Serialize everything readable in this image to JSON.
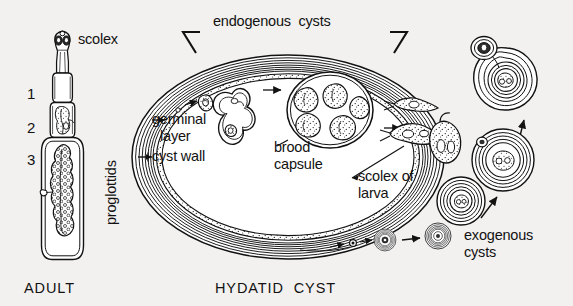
{
  "figure": {
    "title_left": "ADULT",
    "title_center": "HYDATID CYST",
    "background_color": "#f2f1ef",
    "ink_color": "#121212",
    "type": "scientific-illustration"
  },
  "labels": {
    "scolex": "scolex",
    "proglottids": "proglottids",
    "segment_1": "1",
    "segment_2": "2",
    "segment_3": "3",
    "endogenous_cysts": "endogenous  cysts",
    "germinal_layer": "germinal\nlayer",
    "germinal_layer_line1": "germinal",
    "germinal_layer_line2": "layer",
    "cyst_wall": "cyst wall",
    "brood_capsule_line1": "brood",
    "brood_capsule_line2": "capsule",
    "scolex_of_larva_line1": "scolex of",
    "scolex_of_larva_line2": "larva",
    "exogenous_cysts_line1": "exogenous",
    "exogenous_cysts_line2": "cysts",
    "adult": "ADULT",
    "hydatid_cyst": "HYDATID  CYST"
  },
  "structures": {
    "adult_worm": {
      "name": "adult tapeworm",
      "parts": [
        "scolex with suckers",
        "neck",
        "immature proglottid",
        "mature proglottid",
        "gravid proglottid"
      ],
      "segment_count": 3
    },
    "hydatid_cyst": {
      "name": "hydatid cyst",
      "wall_layers": [
        "laminated cyst wall",
        "germinal layer"
      ],
      "contents": [
        "germinal bud",
        "invaginating brood capsule",
        "brood capsule with protoscoleces",
        "free protoscoleces",
        "daughter capsule"
      ],
      "brood_capsule_protoscolex_count": 5
    },
    "exogenous_cysts": {
      "name": "exogenous daughter cysts",
      "count": 4
    }
  }
}
